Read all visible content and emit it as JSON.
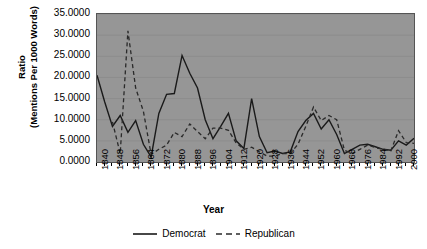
{
  "chart_data": {
    "type": "line",
    "title": "",
    "xlabel": "Year",
    "ylabel": "Ratio\n(Mentions Per 1000 Words)",
    "ylabel_line1": "Ratio",
    "ylabel_line2": "(Mentions Per 1000 Words)",
    "ylim": [
      0,
      35
    ],
    "ytick_values": [
      35.0,
      30.0,
      25.0,
      20.0,
      15.0,
      10.0,
      5.0,
      0.0
    ],
    "ytick_labels": [
      "35.0000",
      "30.0000",
      "25.0000",
      "20.0000",
      "15.0000",
      "10.0000",
      "5.0000",
      "0.0000"
    ],
    "xlim": [
      1840,
      2004
    ],
    "xtick_labels": [
      "1840",
      "1848",
      "1856",
      "1864",
      "1872",
      "1880",
      "1888",
      "1896",
      "1904",
      "1912",
      "1920",
      "1928",
      "1936",
      "1944",
      "1952",
      "1960",
      "1968",
      "1976",
      "1984",
      "1992",
      "2000"
    ],
    "xtick_step": 8,
    "minor_tick_step": 4,
    "grid": "horizontal",
    "legend_position": "bottom-center",
    "plot_background": "#969696",
    "line_color": "#1a1a1a",
    "x": [
      1840,
      1844,
      1848,
      1852,
      1856,
      1860,
      1864,
      1868,
      1872,
      1876,
      1880,
      1884,
      1888,
      1892,
      1896,
      1900,
      1904,
      1908,
      1912,
      1916,
      1920,
      1924,
      1928,
      1932,
      1936,
      1940,
      1944,
      1948,
      1952,
      1956,
      1960,
      1964,
      1968,
      1972,
      1976,
      1980,
      1984,
      1988,
      1992,
      1996,
      2000,
      2004
    ],
    "series": [
      {
        "name": "Democrat",
        "style": "solid",
        "color": "#1a1a1a",
        "values": [
          20.5,
          14.2,
          8.4,
          11.0,
          7.0,
          9.8,
          4.2,
          1.2,
          11.5,
          16.0,
          16.2,
          25.2,
          21.0,
          17.5,
          10.0,
          5.5,
          8.4,
          11.5,
          5.0,
          3.2,
          15.0,
          6.0,
          2.2,
          2.6,
          2.0,
          2.4,
          7.2,
          9.8,
          11.5,
          7.8,
          10.0,
          6.5,
          2.0,
          3.0,
          4.0,
          4.2,
          3.6,
          3.0,
          2.8,
          5.0,
          4.0,
          5.6
        ]
      },
      {
        "name": "Republican",
        "style": "dashed",
        "color": "#1a1a1a",
        "values": [
          null,
          null,
          9.5,
          2.0,
          31.0,
          17.5,
          12.0,
          1.8,
          3.0,
          4.0,
          7.0,
          6.0,
          9.0,
          7.2,
          5.5,
          8.0,
          8.0,
          7.5,
          4.5,
          3.0,
          3.5,
          2.4,
          1.4,
          1.4,
          2.0,
          2.0,
          4.2,
          8.4,
          13.0,
          9.8,
          11.0,
          10.0,
          2.8,
          2.0,
          3.0,
          4.0,
          3.4,
          3.0,
          2.6,
          7.4,
          4.6,
          4.4
        ]
      }
    ]
  },
  "legend": {
    "items": [
      {
        "label": "Democrat",
        "style": "solid"
      },
      {
        "label": "Republican",
        "style": "dashed"
      }
    ]
  },
  "axes": {
    "x_title": "Year",
    "y_title_line1": "Ratio",
    "y_title_line2": "(Mentions Per 1000 Words)"
  }
}
